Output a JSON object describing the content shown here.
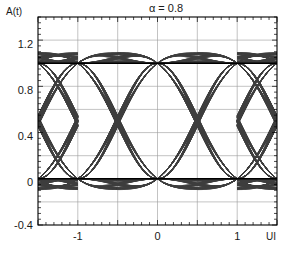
{
  "chart_data": {
    "type": "line",
    "title": "α = 0.8",
    "xlabel": "",
    "ylabel": "A(t)",
    "x_unit_label": "UI",
    "xlim": [
      -1.5,
      1.5
    ],
    "ylim": [
      -0.4,
      1.4
    ],
    "xticks": [
      -1.5,
      -1.0,
      -0.5,
      0.0,
      0.5,
      1.0,
      1.5
    ],
    "xtick_labels": [
      "",
      "-1",
      "",
      "0",
      "",
      "1",
      ""
    ],
    "yticks": [
      -0.4,
      -0.2,
      0.0,
      0.2,
      0.4,
      0.6,
      0.8,
      1.0,
      1.2,
      1.4
    ],
    "ytick_labels": [
      "-0.4",
      "",
      "0",
      "",
      "0.4",
      "",
      "0.8",
      "",
      "1.2",
      ""
    ],
    "y_major_labeled": [
      "1.2",
      "0.8",
      "0.4",
      "0",
      "-0.4"
    ],
    "minor_tick_spacing_x": 0.1,
    "minor_tick_spacing_y": 0.05,
    "grid": true,
    "grid_x_interval": 0.5,
    "grid_y_interval": 0.2,
    "legend": null,
    "legend_position": "none",
    "rolloff_alpha": 0.8,
    "eye_crossing_level": 0.5,
    "upper_level": 1.0,
    "lower_level": 0.0,
    "symbol_period_ui": 1.0,
    "series": [
      {
        "name": "pattern-000",
        "bits": [
          0,
          0,
          0,
          0,
          0,
          0,
          0
        ]
      },
      {
        "name": "pattern-001",
        "bits": [
          0,
          0,
          0,
          0,
          0,
          0,
          1
        ]
      },
      {
        "name": "pattern-010",
        "bits": [
          0,
          0,
          0,
          0,
          1,
          0,
          0
        ]
      },
      {
        "name": "pattern-011",
        "bits": [
          0,
          0,
          0,
          0,
          1,
          1,
          0
        ]
      },
      {
        "name": "pattern-100",
        "bits": [
          0,
          0,
          1,
          0,
          0,
          0,
          0
        ]
      },
      {
        "name": "pattern-101",
        "bits": [
          0,
          1,
          0,
          1,
          0,
          1,
          0
        ]
      },
      {
        "name": "pattern-110",
        "bits": [
          0,
          1,
          1,
          0,
          0,
          0,
          0
        ]
      },
      {
        "name": "pattern-111",
        "bits": [
          1,
          1,
          1,
          1,
          1,
          1,
          1
        ]
      },
      {
        "name": "pattern-0110",
        "bits": [
          0,
          0,
          1,
          1,
          0,
          0,
          0
        ]
      },
      {
        "name": "pattern-1001",
        "bits": [
          1,
          1,
          0,
          0,
          1,
          1,
          1
        ]
      },
      {
        "name": "pattern-0100",
        "bits": [
          0,
          0,
          0,
          1,
          0,
          0,
          0
        ]
      },
      {
        "name": "pattern-1011",
        "bits": [
          1,
          1,
          1,
          0,
          1,
          1,
          1
        ]
      }
    ],
    "curve_color": "#3d3d3d",
    "axis_color": "#000000",
    "grid_color": "#9a9a9a"
  },
  "colors": {
    "background": "#ffffff",
    "foreground": "#000000",
    "grid": "#9a9a9a",
    "trace": "#3d3d3d"
  },
  "caption": ""
}
